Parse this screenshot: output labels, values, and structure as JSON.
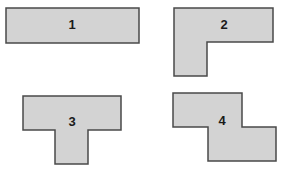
{
  "figure": {
    "fill_color": "#d3d3d3",
    "stroke_color": "#4a4a4a",
    "shapes": [
      {
        "id": "1",
        "label": "1",
        "type": "rectangle"
      },
      {
        "id": "2",
        "label": "2",
        "type": "L-shape"
      },
      {
        "id": "3",
        "label": "3",
        "type": "T-shape"
      },
      {
        "id": "4",
        "label": "4",
        "type": "Z-shape"
      }
    ]
  }
}
